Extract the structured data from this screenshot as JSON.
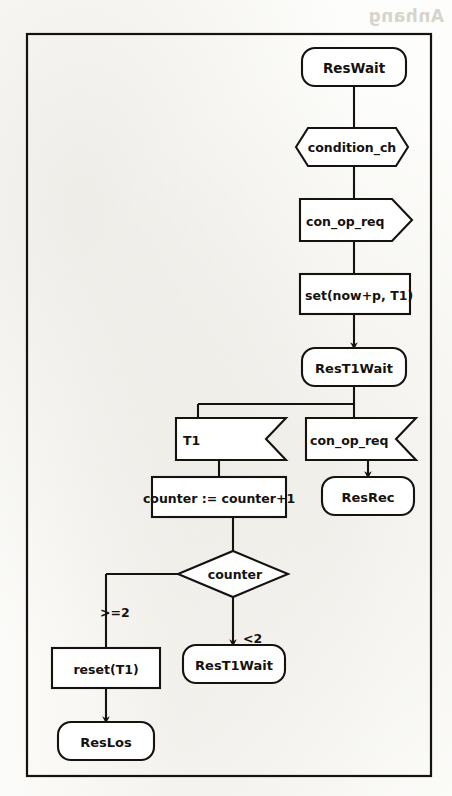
{
  "page": {
    "width": 452,
    "height": 796,
    "background_color": "#fdfdfb",
    "ink_color": "#15120f",
    "frame": {
      "x": 26,
      "y": 33,
      "width": 406,
      "height": 744
    },
    "bleed_through_text": "Anhang"
  },
  "diagram": {
    "type": "sdl-process-flowchart",
    "nodes": [
      {
        "id": "state_reswait",
        "kind": "state",
        "label": "ResWait",
        "x": 302,
        "y": 48,
        "width": 104,
        "height": 38
      },
      {
        "id": "input_condition",
        "kind": "input",
        "label": "condition_ch",
        "x": 296,
        "y": 128,
        "width": 112,
        "height": 38
      },
      {
        "id": "output_conopreq",
        "kind": "output",
        "label": "con_op_req",
        "x": 300,
        "y": 199,
        "width": 108,
        "height": 42
      },
      {
        "id": "task_settimer",
        "kind": "task",
        "label": "set(now+p, T1)",
        "x": 300,
        "y": 274,
        "width": 108,
        "height": 40
      },
      {
        "id": "state_rest1wait",
        "kind": "state",
        "label": "ResT1Wait",
        "x": 302,
        "y": 348,
        "width": 104,
        "height": 38
      },
      {
        "id": "input_t1",
        "kind": "input",
        "label": "T1",
        "x": 176,
        "y": 418,
        "width": 110,
        "height": 42
      },
      {
        "id": "input_conopreq2",
        "kind": "input",
        "label": "con_op_req",
        "x": 306,
        "y": 418,
        "width": 110,
        "height": 42
      },
      {
        "id": "task_counter",
        "kind": "task",
        "label": "counter := counter+1",
        "x": 152,
        "y": 477,
        "width": 134,
        "height": 40
      },
      {
        "id": "state_resrec",
        "kind": "state",
        "label": "ResRec",
        "x": 322,
        "y": 477,
        "width": 92,
        "height": 38
      },
      {
        "id": "decision_counter",
        "kind": "decision",
        "label": "counter",
        "x": 178,
        "y": 551,
        "width": 110,
        "height": 46
      },
      {
        "id": "task_resettimer",
        "kind": "task",
        "label": "reset(T1)",
        "x": 52,
        "y": 648,
        "width": 108,
        "height": 40
      },
      {
        "id": "state_rest1wait2",
        "kind": "state",
        "label": "ResT1Wait",
        "x": 189,
        "y": 645,
        "width": 102,
        "height": 38
      },
      {
        "id": "state_reslos",
        "kind": "state",
        "label": "ResLos",
        "x": 58,
        "y": 722,
        "width": 96,
        "height": 38
      }
    ],
    "edges": [
      {
        "id": "e1",
        "from": "state_reswait",
        "to": "input_condition",
        "label": "",
        "arrow": false
      },
      {
        "id": "e2",
        "from": "input_condition",
        "to": "output_conopreq",
        "label": "",
        "arrow": false
      },
      {
        "id": "e3",
        "from": "output_conopreq",
        "to": "task_settimer",
        "label": "",
        "arrow": false
      },
      {
        "id": "e4",
        "from": "task_settimer",
        "to": "state_rest1wait",
        "label": "",
        "arrow": true
      },
      {
        "id": "e5",
        "from": "state_rest1wait",
        "to": "input_t1",
        "label": "",
        "arrow": false
      },
      {
        "id": "e6",
        "from": "state_rest1wait",
        "to": "input_conopreq2",
        "label": "",
        "arrow": false
      },
      {
        "id": "e7",
        "from": "input_t1",
        "to": "task_counter",
        "label": "",
        "arrow": false
      },
      {
        "id": "e8",
        "from": "input_conopreq2",
        "to": "state_resrec",
        "label": "",
        "arrow": true
      },
      {
        "id": "e9",
        "from": "task_counter",
        "to": "decision_counter",
        "label": "",
        "arrow": false
      },
      {
        "id": "e10",
        "from": "decision_counter",
        "to": "task_resettimer",
        "label": ">=2",
        "arrow": false
      },
      {
        "id": "e11",
        "from": "decision_counter",
        "to": "state_rest1wait2",
        "label": "<2",
        "arrow": true
      },
      {
        "id": "e12",
        "from": "task_resettimer",
        "to": "state_reslos",
        "label": "",
        "arrow": true
      }
    ],
    "labels": {
      "branch_ge2": ">=2",
      "branch_lt2": "<2"
    }
  }
}
